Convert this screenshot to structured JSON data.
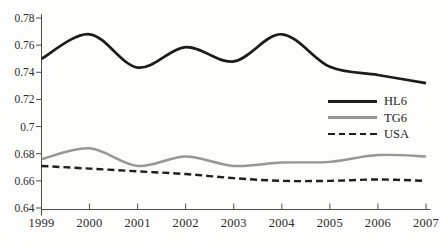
{
  "figure": {
    "background": "#fdfdfc",
    "axis_color": "#4d4d4d",
    "tick_color": "#4d4d4d",
    "label_color": "#2b2b2b"
  },
  "chart_data": {
    "type": "line",
    "title": "",
    "xlabel": "",
    "ylabel": "",
    "grid": false,
    "legend_position": "right-center",
    "x": [
      1999,
      2000,
      2001,
      2002,
      2003,
      2004,
      2005,
      2006,
      2007
    ],
    "xtick_labels": [
      "1999",
      "2000",
      "2001",
      "2002",
      "2003",
      "2004",
      "2005",
      "2006",
      "2007"
    ],
    "ylim": [
      0.64,
      0.78
    ],
    "ytick_values": [
      0.78,
      0.76,
      0.74,
      0.72,
      0.7,
      0.68,
      0.66,
      0.64
    ],
    "ytick_labels": [
      "0.78",
      "0.76",
      "0.74",
      "0.72",
      "0.7",
      "0.68",
      "0.66",
      "0.64"
    ],
    "series": [
      {
        "name": "HL6",
        "color": "#1c1c1c",
        "dash": "solid",
        "stroke_width": 2.7,
        "values": [
          0.75,
          0.768,
          0.7435,
          0.7585,
          0.748,
          0.768,
          0.744,
          0.738,
          0.732
        ]
      },
      {
        "name": "TG6",
        "color": "#979797",
        "dash": "solid",
        "stroke_width": 2.4,
        "values": [
          0.676,
          0.684,
          0.671,
          0.678,
          0.671,
          0.6735,
          0.674,
          0.679,
          0.678
        ]
      },
      {
        "name": "USA",
        "color": "#1f1f1f",
        "dash": "dashed",
        "stroke_width": 2.4,
        "values": [
          0.671,
          0.669,
          0.667,
          0.665,
          0.662,
          0.66,
          0.66,
          0.661,
          0.66
        ]
      }
    ]
  }
}
